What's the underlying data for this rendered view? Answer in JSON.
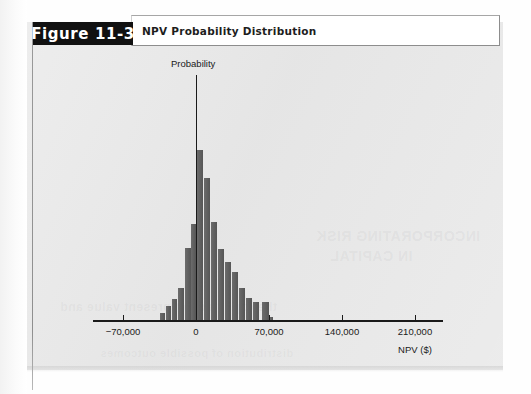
{
  "figure": {
    "tag_label": "Figure 11-3",
    "caption": "NPV Probability Distribution"
  },
  "ghost_text": {
    "line1": "INCORPORATING RISK",
    "line2": "IN CAPITAL",
    "line3": "the expected net present value and",
    "line4": "distribution of possible outcomes"
  },
  "colors": {
    "panel_background": "#e8e8e8",
    "bar_fill": "#5b5b5b",
    "axis": "#1a1a1a",
    "tag_background": "#111111",
    "tag_text": "#ffffff",
    "caption_box": "#ffffff"
  },
  "chart_data": {
    "type": "bar",
    "title": "NPV Probability Distribution",
    "xlabel": "NPV ($)",
    "ylabel": "Probability",
    "grid": false,
    "legend": null,
    "xlim": [
      -105000,
      245000
    ],
    "xticks": [
      -70000,
      0,
      70000,
      140000,
      210000
    ],
    "xtick_labels": [
      "−70,000",
      "0",
      "70,000",
      "140,000",
      "210,000"
    ],
    "yaxis_shown_as_arrow_line": true,
    "ytick_labels": [],
    "bar_count": 17,
    "categories": [
      -34000,
      -29000,
      -24000,
      -19000,
      -14000,
      -9000,
      -4000,
      1000,
      6000,
      11000,
      16000,
      21000,
      26000,
      31000,
      41000,
      51000,
      61000
    ],
    "values": [
      0.013,
      0.031,
      0.063,
      0.152,
      0.294,
      0.452,
      1.0,
      0.776,
      0.559,
      0.376,
      0.277,
      0.204,
      0.126,
      0.082,
      0.051,
      0.051,
      0.008
    ],
    "value_note": "heights relative to the modal bar (= 1.000), read off pixel extents",
    "bar_pixel_geometry": [
      {
        "left": 160,
        "width": 5,
        "top": 313
      },
      {
        "left": 166,
        "width": 5,
        "top": 306
      },
      {
        "left": 172,
        "width": 5,
        "top": 299
      },
      {
        "left": 178,
        "width": 6,
        "top": 288
      },
      {
        "left": 185,
        "width": 6,
        "top": 248
      },
      {
        "left": 191,
        "width": 5,
        "top": 224
      },
      {
        "left": 197,
        "width": 6,
        "top": 150
      },
      {
        "left": 204,
        "width": 6,
        "top": 178
      },
      {
        "left": 211,
        "width": 6,
        "top": 222
      },
      {
        "left": 218,
        "width": 6,
        "top": 249
      },
      {
        "left": 225,
        "width": 6,
        "top": 262
      },
      {
        "left": 232,
        "width": 6,
        "top": 272
      },
      {
        "left": 239,
        "width": 6,
        "top": 288
      },
      {
        "left": 246,
        "width": 6,
        "top": 298
      },
      {
        "left": 253,
        "width": 6,
        "top": 302
      },
      {
        "left": 262,
        "width": 7,
        "top": 302
      },
      {
        "left": 270,
        "width": 3,
        "top": 317
      }
    ]
  }
}
